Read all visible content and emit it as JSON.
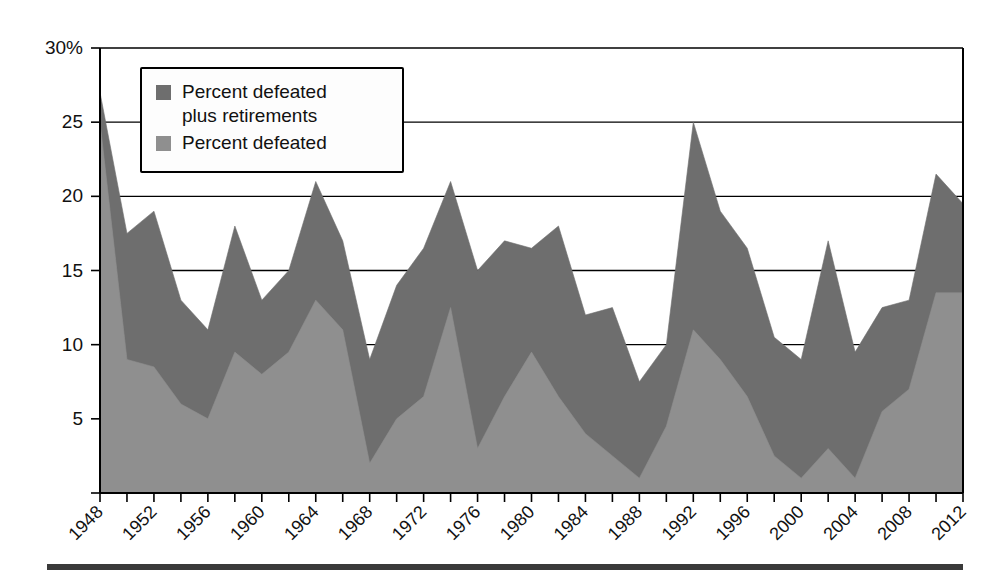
{
  "chart_data": {
    "type": "area",
    "title": "",
    "subtitle": "",
    "xlabel": "",
    "ylabel": "",
    "xlim": [
      1948,
      2012
    ],
    "ylim": [
      0,
      30
    ],
    "ytick_values": [
      0,
      5,
      10,
      15,
      20,
      25,
      30
    ],
    "ytick_labels": [
      "",
      "5",
      "10",
      "15",
      "20",
      "25",
      "30%"
    ],
    "xtick_labels": [
      "1948",
      "1952",
      "1956",
      "1960",
      "1964",
      "1968",
      "1972",
      "1976",
      "1980",
      "1984",
      "1988",
      "1992",
      "1996",
      "2000",
      "2004",
      "2008",
      "2012"
    ],
    "xtick_values": [
      1948,
      1952,
      1956,
      1960,
      1964,
      1968,
      1972,
      1976,
      1980,
      1984,
      1988,
      1992,
      1996,
      2000,
      2004,
      2008,
      2012
    ],
    "minor_tick_interval": 2,
    "grid": "horizontal",
    "legend_position": "top-left-inside",
    "x": [
      1948,
      1950,
      1952,
      1954,
      1956,
      1958,
      1960,
      1962,
      1964,
      1966,
      1968,
      1970,
      1972,
      1974,
      1976,
      1978,
      1980,
      1982,
      1984,
      1986,
      1988,
      1990,
      1992,
      1994,
      1996,
      1998,
      2000,
      2002,
      2004,
      2006,
      2008,
      2010,
      2012
    ],
    "series": [
      {
        "name": "Percent defeated plus retirements",
        "color": "#6e6e6e",
        "values": [
          27.0,
          17.5,
          19.0,
          13.0,
          11.0,
          18.0,
          13.0,
          15.0,
          21.0,
          17.0,
          9.0,
          14.0,
          16.5,
          21.0,
          15.0,
          17.0,
          16.5,
          18.0,
          12.0,
          12.5,
          7.5,
          10.0,
          25.0,
          19.0,
          16.5,
          10.5,
          9.0,
          17.0,
          9.5,
          12.5,
          13.0,
          21.5,
          19.5
        ]
      },
      {
        "name": "Percent defeated",
        "color": "#8f8f8f",
        "values": [
          25.0,
          9.0,
          8.5,
          6.0,
          5.0,
          9.5,
          8.0,
          9.5,
          13.0,
          11.0,
          2.0,
          5.0,
          6.5,
          12.5,
          3.0,
          6.5,
          9.5,
          6.5,
          4.0,
          2.5,
          1.0,
          4.5,
          11.0,
          9.0,
          6.5,
          2.5,
          1.0,
          3.0,
          1.0,
          5.5,
          7.0,
          13.5,
          13.5
        ]
      }
    ]
  },
  "legend": {
    "entries": [
      {
        "label_line1": "Percent defeated",
        "label_line2": "plus retirements",
        "swatch_color": "#6e6e6e"
      },
      {
        "label_line1": "Percent defeated",
        "label_line2": "",
        "swatch_color": "#8f8f8f"
      }
    ]
  },
  "colors": {
    "series_dark": "#6e6e6e",
    "series_light": "#8f8f8f",
    "axis": "#000000",
    "background": "#ffffff",
    "rule": "#3a3a3a"
  }
}
